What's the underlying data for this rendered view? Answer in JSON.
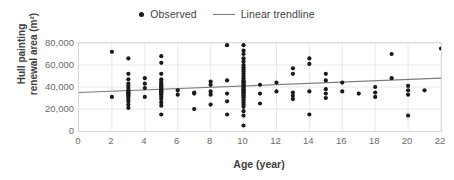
{
  "chart_data": {
    "type": "scatter",
    "title": "",
    "xlabel": "Age (year)",
    "ylabel": "Hull painting renewal area (m²)",
    "ylabel_line1": "Hull painting",
    "ylabel_line2": "renewal area (m²)",
    "xlim": [
      0,
      22
    ],
    "ylim": [
      0,
      80000
    ],
    "xticks": [
      0,
      2,
      4,
      6,
      8,
      10,
      12,
      14,
      16,
      18,
      20,
      22
    ],
    "xtick_labels": [
      "0",
      "2",
      "4",
      "6",
      "8",
      "10",
      "12",
      "14",
      "16",
      "18",
      "20",
      "22"
    ],
    "yticks": [
      0,
      20000,
      40000,
      60000,
      80000
    ],
    "ytick_labels": [
      "0",
      "20,000",
      "40,000",
      "60,000",
      "80,000"
    ],
    "grid": "horizontal-and-vertical-light",
    "legend_position": "top-center",
    "marker_color": "#1a1a1a",
    "trendline_color": "#7a7a7a",
    "gridline_color": "#e8e8e8",
    "axis_border_color": "#d8d8d8",
    "series": [
      {
        "name": "Observed",
        "marker": "circle",
        "points": [
          [
            2,
            72000
          ],
          [
            2,
            31000
          ],
          [
            3,
            66000
          ],
          [
            3,
            52000
          ],
          [
            3,
            47000
          ],
          [
            3,
            43000
          ],
          [
            3,
            41000
          ],
          [
            3,
            39000
          ],
          [
            3,
            37000
          ],
          [
            3,
            36000
          ],
          [
            3,
            35000
          ],
          [
            3,
            34000
          ],
          [
            3,
            33000
          ],
          [
            3,
            32000
          ],
          [
            3,
            31000
          ],
          [
            3,
            29000
          ],
          [
            3,
            27000
          ],
          [
            3,
            24000
          ],
          [
            3,
            21000
          ],
          [
            4,
            48000
          ],
          [
            4,
            43000
          ],
          [
            4,
            39000
          ],
          [
            4,
            31000
          ],
          [
            5,
            68000
          ],
          [
            5,
            62000
          ],
          [
            5,
            52000
          ],
          [
            5,
            47000
          ],
          [
            5,
            45000
          ],
          [
            5,
            43000
          ],
          [
            5,
            42000
          ],
          [
            5,
            41000
          ],
          [
            5,
            40000
          ],
          [
            5,
            39000
          ],
          [
            5,
            38000
          ],
          [
            5,
            37000
          ],
          [
            5,
            36000
          ],
          [
            5,
            35000
          ],
          [
            5,
            34000
          ],
          [
            5,
            33000
          ],
          [
            5,
            31000
          ],
          [
            5,
            29000
          ],
          [
            5,
            26000
          ],
          [
            5,
            23000
          ],
          [
            5,
            15000
          ],
          [
            6,
            37000
          ],
          [
            6,
            33000
          ],
          [
            7,
            35000
          ],
          [
            7,
            34000
          ],
          [
            7,
            20000
          ],
          [
            8,
            45000
          ],
          [
            8,
            42000
          ],
          [
            8,
            36000
          ],
          [
            8,
            33000
          ],
          [
            8,
            24000
          ],
          [
            9,
            78000
          ],
          [
            9,
            46000
          ],
          [
            9,
            34000
          ],
          [
            9,
            27000
          ],
          [
            9,
            15000
          ],
          [
            10,
            78000
          ],
          [
            10,
            73000
          ],
          [
            10,
            70000
          ],
          [
            10,
            66000
          ],
          [
            10,
            63000
          ],
          [
            10,
            60000
          ],
          [
            10,
            58000
          ],
          [
            10,
            56000
          ],
          [
            10,
            54000
          ],
          [
            10,
            52000
          ],
          [
            10,
            50000
          ],
          [
            10,
            48000
          ],
          [
            10,
            46000
          ],
          [
            10,
            45000
          ],
          [
            10,
            44000
          ],
          [
            10,
            43000
          ],
          [
            10,
            42000
          ],
          [
            10,
            41000
          ],
          [
            10,
            40000
          ],
          [
            10,
            39000
          ],
          [
            10,
            38000
          ],
          [
            10,
            37000
          ],
          [
            10,
            36000
          ],
          [
            10,
            35000
          ],
          [
            10,
            34000
          ],
          [
            10,
            33000
          ],
          [
            10,
            32000
          ],
          [
            10,
            31000
          ],
          [
            10,
            30000
          ],
          [
            10,
            28000
          ],
          [
            10,
            26000
          ],
          [
            10,
            24000
          ],
          [
            10,
            22000
          ],
          [
            10,
            18000
          ],
          [
            10,
            14000
          ],
          [
            10,
            5000
          ],
          [
            11,
            42000
          ],
          [
            11,
            34000
          ],
          [
            11,
            25000
          ],
          [
            12,
            44000
          ],
          [
            12,
            36000
          ],
          [
            13,
            57000
          ],
          [
            13,
            52000
          ],
          [
            13,
            35000
          ],
          [
            13,
            32000
          ],
          [
            13,
            29000
          ],
          [
            14,
            66000
          ],
          [
            14,
            61000
          ],
          [
            14,
            36000
          ],
          [
            14,
            15000
          ],
          [
            15,
            52000
          ],
          [
            15,
            46000
          ],
          [
            15,
            38000
          ],
          [
            15,
            34000
          ],
          [
            15,
            30000
          ],
          [
            16,
            44000
          ],
          [
            16,
            36000
          ],
          [
            17,
            34000
          ],
          [
            18,
            40000
          ],
          [
            18,
            35000
          ],
          [
            18,
            31000
          ],
          [
            19,
            70000
          ],
          [
            19,
            48000
          ],
          [
            20,
            41000
          ],
          [
            20,
            37000
          ],
          [
            20,
            33000
          ],
          [
            20,
            14000
          ],
          [
            21,
            37000
          ],
          [
            22,
            75000
          ]
        ]
      }
    ],
    "trendline": {
      "name": "Linear trendline",
      "x_start": 0,
      "y_start": 35000,
      "x_end": 22,
      "y_end": 48000
    }
  },
  "legend": {
    "observed_label": "Observed",
    "trendline_label": "Linear trendline"
  }
}
